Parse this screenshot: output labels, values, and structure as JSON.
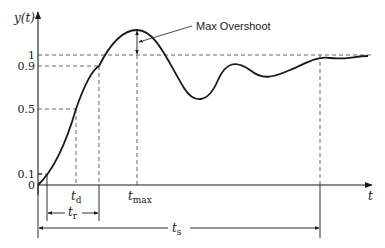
{
  "diagram": {
    "y_axis_label": "y(t)",
    "x_axis_label": "t",
    "y_ticks": [
      {
        "label": "1",
        "y": 55
      },
      {
        "label": "0.9",
        "y": 66
      },
      {
        "label": "0.5",
        "y": 109
      },
      {
        "label": "0.1",
        "y": 174
      },
      {
        "label": "0",
        "y": 185
      }
    ],
    "time_markers": {
      "t_d": {
        "base": "t",
        "sub": "d",
        "x": 76
      },
      "t_r": {
        "base": "t",
        "sub": "r",
        "x_start": 47,
        "x_end": 99
      },
      "t_max": {
        "base": "t",
        "sub": "max",
        "x": 137
      },
      "t_s": {
        "base": "t",
        "sub": "s",
        "x_start": 38,
        "x_end": 320
      }
    },
    "annotation": {
      "label": "Max Overshoot"
    },
    "colors": {
      "curve": "#1a1a1a",
      "axes": "#1a1a1a",
      "dashed": "#555555",
      "text": "#1a1a1a"
    }
  }
}
